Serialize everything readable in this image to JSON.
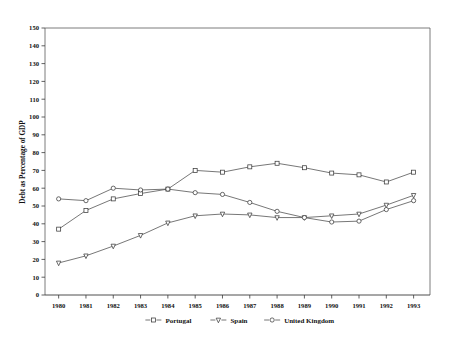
{
  "chart_data": {
    "type": "line",
    "title": "",
    "subtitle": "",
    "xlabel": "",
    "ylabel": "Debt as Percentage of GDP",
    "x": [
      1980,
      1981,
      1982,
      1983,
      1984,
      1985,
      1986,
      1987,
      1988,
      1989,
      1990,
      1991,
      1992,
      1993
    ],
    "categories": [
      "1980",
      "1981",
      "1982",
      "1983",
      "1984",
      "1985",
      "1986",
      "1987",
      "1988",
      "1989",
      "1990",
      "1991",
      "1992",
      "1993"
    ],
    "xlim": [
      1979.5,
      1993.6
    ],
    "ylim": [
      0,
      150
    ],
    "ytick_values": [
      0,
      10,
      20,
      30,
      40,
      50,
      60,
      70,
      80,
      90,
      100,
      110,
      120,
      130,
      140,
      150
    ],
    "ytick_labels": [
      "0",
      "10",
      "20",
      "30",
      "40",
      "50",
      "60",
      "70",
      "80",
      "90",
      "100",
      "110",
      "120",
      "130",
      "140",
      "150"
    ],
    "grid": false,
    "legend_position": "bottom",
    "series": [
      {
        "name": "Portugal",
        "marker": "square",
        "values": [
          37,
          47.5,
          54,
          57,
          59.5,
          70,
          69,
          72,
          74,
          71.5,
          68.5,
          67.5,
          63.5,
          69
        ]
      },
      {
        "name": "Spain",
        "marker": "triangle-down",
        "values": [
          18,
          22,
          27.5,
          33.5,
          40.5,
          44.5,
          45.5,
          45,
          43.5,
          43.5,
          44.5,
          45.5,
          50.5,
          56
        ]
      },
      {
        "name": "United Kingdom",
        "marker": "circle",
        "values": [
          54,
          53,
          60,
          59,
          59.5,
          57.5,
          56.5,
          52,
          47,
          43.5,
          41,
          41.5,
          48,
          53
        ]
      }
    ]
  },
  "legend": {
    "entries": [
      {
        "label": "Portugal",
        "marker": "square"
      },
      {
        "label": "Spain",
        "marker": "triangle-down"
      },
      {
        "label": "United Kingdom",
        "marker": "circle"
      }
    ]
  }
}
